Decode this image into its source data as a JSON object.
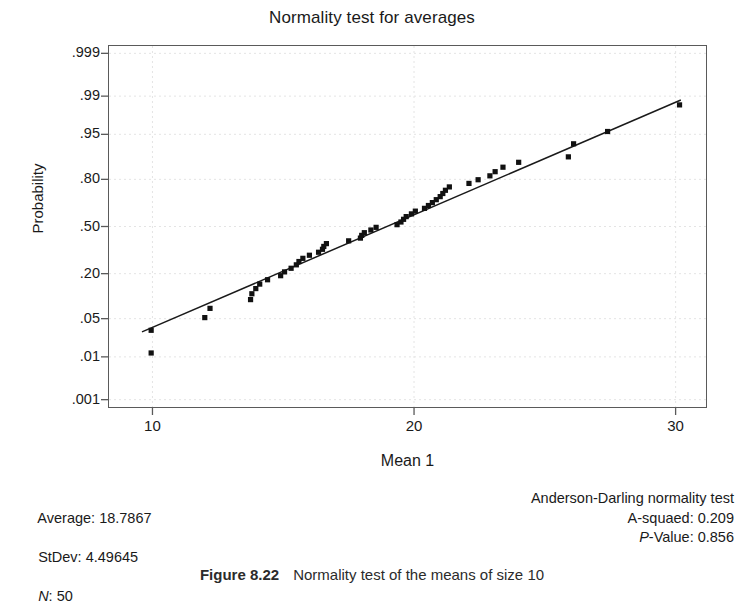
{
  "figure": {
    "caption_label": "Figure 8.22",
    "caption_text": "Normality test of the means of size 10"
  },
  "chart_data": {
    "type": "scatter",
    "title": "Normality test for averages",
    "xlabel": "Mean 1",
    "ylabel": "Probability",
    "grid": true,
    "legend": "none",
    "xlim": [
      8.3,
      31.2
    ],
    "ylim_probability": [
      0.0006,
      0.9994
    ],
    "xticks": [
      10,
      20,
      30
    ],
    "xtick_labels": [
      "10",
      "20",
      "30"
    ],
    "yticks": [
      0.999,
      0.99,
      0.95,
      0.8,
      0.5,
      0.2,
      0.05,
      0.01,
      0.001
    ],
    "ytick_labels": [
      ".999",
      ".99",
      ".95",
      ".80",
      ".50",
      ".20",
      ".05",
      ".01",
      ".001"
    ],
    "fit_line": {
      "label": "normal probability fit line",
      "x_start": 9.6,
      "y_start_probability": 0.03,
      "x_end": 30.2,
      "y_end_probability": 0.988
    },
    "points": [
      {
        "x": 9.95,
        "p": 0.012
      },
      {
        "x": 9.95,
        "p": 0.032
      },
      {
        "x": 12.0,
        "p": 0.052
      },
      {
        "x": 12.2,
        "p": 0.072
      },
      {
        "x": 13.75,
        "p": 0.096
      },
      {
        "x": 13.8,
        "p": 0.115
      },
      {
        "x": 13.95,
        "p": 0.134
      },
      {
        "x": 14.1,
        "p": 0.152
      },
      {
        "x": 14.4,
        "p": 0.171
      },
      {
        "x": 14.9,
        "p": 0.19
      },
      {
        "x": 15.05,
        "p": 0.209
      },
      {
        "x": 15.3,
        "p": 0.228
      },
      {
        "x": 15.5,
        "p": 0.247
      },
      {
        "x": 15.6,
        "p": 0.266
      },
      {
        "x": 15.75,
        "p": 0.285
      },
      {
        "x": 16.0,
        "p": 0.304
      },
      {
        "x": 16.35,
        "p": 0.323
      },
      {
        "x": 16.5,
        "p": 0.342
      },
      {
        "x": 16.55,
        "p": 0.361
      },
      {
        "x": 16.65,
        "p": 0.38
      },
      {
        "x": 17.5,
        "p": 0.399
      },
      {
        "x": 17.95,
        "p": 0.418
      },
      {
        "x": 18.0,
        "p": 0.437
      },
      {
        "x": 18.1,
        "p": 0.456
      },
      {
        "x": 18.35,
        "p": 0.475
      },
      {
        "x": 18.55,
        "p": 0.494
      },
      {
        "x": 19.35,
        "p": 0.513
      },
      {
        "x": 19.5,
        "p": 0.532
      },
      {
        "x": 19.6,
        "p": 0.551
      },
      {
        "x": 19.7,
        "p": 0.57
      },
      {
        "x": 19.9,
        "p": 0.589
      },
      {
        "x": 20.05,
        "p": 0.608
      },
      {
        "x": 20.4,
        "p": 0.627
      },
      {
        "x": 20.55,
        "p": 0.646
      },
      {
        "x": 20.7,
        "p": 0.665
      },
      {
        "x": 20.85,
        "p": 0.684
      },
      {
        "x": 21.0,
        "p": 0.703
      },
      {
        "x": 21.1,
        "p": 0.722
      },
      {
        "x": 21.2,
        "p": 0.741
      },
      {
        "x": 21.35,
        "p": 0.76
      },
      {
        "x": 22.1,
        "p": 0.779
      },
      {
        "x": 22.45,
        "p": 0.798
      },
      {
        "x": 22.9,
        "p": 0.817
      },
      {
        "x": 23.1,
        "p": 0.836
      },
      {
        "x": 23.4,
        "p": 0.855
      },
      {
        "x": 24.0,
        "p": 0.874
      },
      {
        "x": 25.9,
        "p": 0.893
      },
      {
        "x": 26.1,
        "p": 0.93
      },
      {
        "x": 27.4,
        "p": 0.955
      },
      {
        "x": 30.15,
        "p": 0.985
      }
    ]
  },
  "stats": {
    "left": {
      "average_label": "Average:",
      "average_value": "18.7867",
      "stdev_label": "StDev:",
      "stdev_value": "4.49645",
      "n_label": "N",
      "n_value": ": 50"
    },
    "right": {
      "test_name": "Anderson-Darling normality test",
      "a_squared_label": "A-squaed:",
      "a_squared_value": "0.209",
      "p_value_label": "P",
      "p_value_suffix": "-Value: 0.856"
    }
  }
}
